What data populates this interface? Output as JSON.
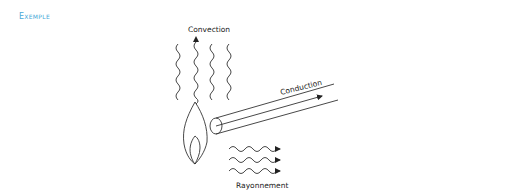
{
  "heading": {
    "label": "Exemple",
    "color": "#4aa9d8"
  },
  "diagram": {
    "labels": {
      "convection": "Convection",
      "conduction": "Conduction",
      "rayonnement": "Rayonnement"
    },
    "elements": {
      "flame": "flame-icon",
      "rod": "heated-rod",
      "convection_waves": 4,
      "radiation_waves": 3
    },
    "stroke_color": "#333333"
  }
}
